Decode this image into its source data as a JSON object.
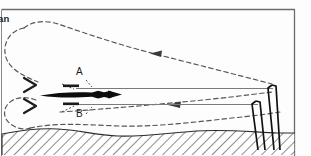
{
  "figure": {
    "title_fragment": "an",
    "width": 311,
    "height": 156,
    "frame_color": "#6b6b6b",
    "background_color": "#fdfdfd"
  },
  "labels": {
    "level_a": "A",
    "level_b": "B"
  },
  "colors": {
    "dashed_flow": "#555555",
    "solid_level": "#777777",
    "mast": "#111111",
    "ground_hatch": "#333333",
    "vessel": "#0d0d0d"
  },
  "elements": {
    "frame": "figure-border",
    "flow_loop_upper": "dashed-circulation-upper",
    "flow_loop_lower": "dashed-circulation-lower",
    "return_arrow_upper": "dashed-arrow-left-upper",
    "return_arrow_lower": "dashed-arrow-left-lower",
    "chevron_upper": "chevron-arrow-upper",
    "chevron_lower": "chevron-arrow-lower",
    "vessel": "vessel-silhouette",
    "level_line_a": "solid-level-line-a",
    "level_line_b": "solid-level-line-b",
    "mast_outer": "vertical-mast-outer",
    "mast_inner": "vertical-mast-inner",
    "ground": "hatched-ground-layer",
    "seabed_line": "dashed-seabed-contour"
  }
}
